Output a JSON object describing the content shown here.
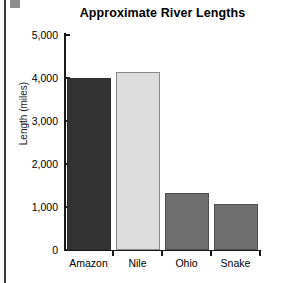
{
  "chart_data": {
    "type": "bar",
    "title": "Approximate River Lengths",
    "xlabel": "",
    "ylabel": "Length (miles)",
    "categories": [
      "Amazon",
      "Nile",
      "Ohio",
      "Snake"
    ],
    "values": [
      4000,
      4150,
      1330,
      1080
    ],
    "ylim": [
      0,
      5000
    ],
    "ytick_values": [
      0,
      1000,
      2000,
      3000,
      4000,
      5000
    ],
    "ytick_labels": [
      "0",
      "1,000",
      "2,000",
      "3,000",
      "4,000",
      "5,000"
    ],
    "grid": false,
    "legend": false,
    "bar_colors": [
      "#333333",
      "#dcdcdc",
      "#6e6e6e",
      "#6e6e6e"
    ],
    "bar_edge_colors": [
      "#2b2b2b",
      "#8a8a8a",
      "#4f4f4f",
      "#4f4f4f"
    ],
    "axis_color": "#1a1a1a",
    "background": "#ffffff"
  }
}
